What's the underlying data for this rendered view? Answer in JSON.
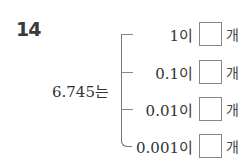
{
  "question": {
    "number": "14",
    "subject": "6.745는",
    "rows": [
      {
        "place": "1이",
        "answer": "",
        "unit": "개"
      },
      {
        "place": "0.1이",
        "answer": "",
        "unit": "개"
      },
      {
        "place": "0.01이",
        "answer": "",
        "unit": "개"
      },
      {
        "place": "0.001이",
        "answer": "",
        "unit": "개"
      }
    ]
  }
}
